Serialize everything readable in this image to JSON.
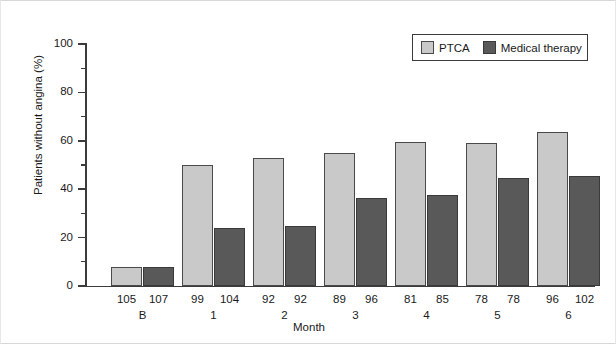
{
  "chart_data": {
    "type": "bar",
    "title": "",
    "xlabel": "Month",
    "ylabel": "Patients without angina (%)",
    "ylim": [
      0,
      100
    ],
    "ytick_labels": [
      "0",
      "20",
      "40",
      "60",
      "80",
      "100"
    ],
    "ytick_values": [
      0,
      20,
      40,
      60,
      80,
      100
    ],
    "yminor_values": [
      10,
      30,
      50,
      70,
      90
    ],
    "grid": false,
    "legend_position": "top-right",
    "categories": [
      "B",
      "1",
      "2",
      "3",
      "4",
      "5",
      "6"
    ],
    "series": [
      {
        "name": "PTCA",
        "color": "#c9c9c9",
        "values": [
          8,
          50,
          53,
          55,
          59.5,
          59,
          63.5
        ],
        "n": [
          105,
          99,
          92,
          89,
          81,
          78,
          96
        ]
      },
      {
        "name": "Medical therapy",
        "color": "#595959",
        "values": [
          8,
          24,
          25,
          36.5,
          37.5,
          44.5,
          45.5
        ],
        "n": [
          107,
          104,
          92,
          96,
          85,
          78,
          102
        ]
      }
    ],
    "n_labels": [
      {
        "ptca": "105",
        "med": "107"
      },
      {
        "ptca": "99",
        "med": "104"
      },
      {
        "ptca": "92",
        "med": "92"
      },
      {
        "ptca": "89",
        "med": "96"
      },
      {
        "ptca": "81",
        "med": "85"
      },
      {
        "ptca": "78",
        "med": "78"
      },
      {
        "ptca": "96",
        "med": "102"
      }
    ]
  },
  "legend": {
    "items": [
      {
        "label": "PTCA",
        "color": "#c9c9c9"
      },
      {
        "label": "Medical therapy",
        "color": "#595959"
      }
    ]
  },
  "axes": {
    "y_title": "Patients without angina (%)",
    "x_title": "Month",
    "y_labels": [
      "100",
      "80",
      "60",
      "40",
      "20",
      "0"
    ]
  }
}
